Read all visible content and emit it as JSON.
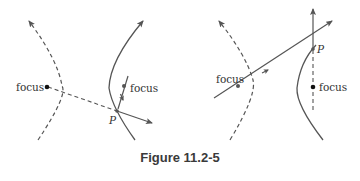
{
  "figure": {
    "caption": "Figure 11.2-5",
    "colors": {
      "stroke": "#555555",
      "dot": "#111111",
      "text": "#333333"
    },
    "left_diagram": {
      "focus_left_label": "focus",
      "focus_right_label": "focus",
      "point_label": "P"
    },
    "right_diagram": {
      "focus_left_label": "focus",
      "focus_right_label": "focus",
      "point_label": "P"
    }
  }
}
